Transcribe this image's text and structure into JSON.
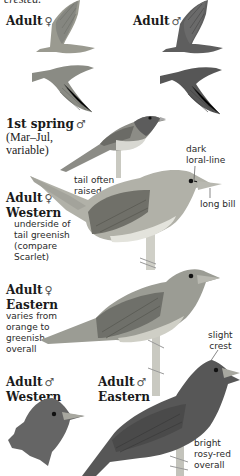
{
  "page": {
    "truncated_top_text": "crested.",
    "species_plate": "Summer Tanager",
    "palette": {
      "background": "#ffffff",
      "text": "#1a1a1a",
      "female_body": "#9a9a90",
      "female_wing": "#6f706a",
      "male_body": "#5e5e5e",
      "male_wing": "#4a4a4a",
      "perch": "#c8c8c0",
      "bill": "#b8b8b0",
      "eye": "#111111"
    }
  },
  "figures": [
    {
      "id": "flight-female",
      "label": "Adult",
      "sex_symbol": "♀"
    },
    {
      "id": "flight-male",
      "label": "Adult",
      "sex_symbol": "♂"
    },
    {
      "id": "first-spring-male",
      "label": "1st spring",
      "sex_symbol": "♂",
      "sub": [
        "(Mar–Jul,",
        "variable)"
      ]
    },
    {
      "id": "female-western",
      "label": "Adult",
      "sex_symbol": "♀",
      "line2": "Western",
      "notes": [
        "underside of",
        "tail greenish",
        "(compare",
        "Scarlet)"
      ]
    },
    {
      "id": "female-eastern",
      "label": "Adult",
      "sex_symbol": "♀",
      "line2": "Eastern",
      "notes": [
        "varies from",
        "orange to",
        "greenish",
        "overall"
      ]
    },
    {
      "id": "male-western",
      "label": "Adult",
      "sex_symbol": "♂",
      "line2": "Western"
    },
    {
      "id": "male-eastern",
      "label": "Adult",
      "sex_symbol": "♂",
      "line2": "Eastern",
      "notes": [
        "bright",
        "rosy-red",
        "overall"
      ]
    }
  ],
  "callouts": {
    "tail": [
      "tail often",
      "raised"
    ],
    "loral": [
      "dark",
      "loral-line"
    ],
    "bill": "long bill",
    "crest": [
      "slight",
      "crest"
    ]
  }
}
